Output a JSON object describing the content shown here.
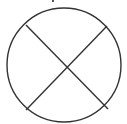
{
  "diagram": {
    "shape": "circle-with-x",
    "stroke_color": "#333333",
    "background": "#ffffff",
    "circle": {
      "cx": 64,
      "cy": 65,
      "r": 57
    },
    "lines": [
      {
        "x1": 26,
        "y1": 25,
        "x2": 108,
        "y2": 109
      },
      {
        "x1": 107,
        "y1": 26,
        "x2": 26,
        "y2": 110
      }
    ]
  }
}
